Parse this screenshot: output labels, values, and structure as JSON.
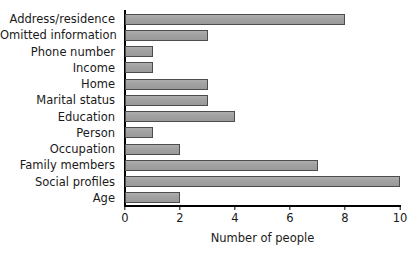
{
  "chart_data": {
    "type": "bar",
    "orientation": "horizontal",
    "title": "",
    "subtitle": "",
    "xlabel": "Number of people",
    "ylabel": "",
    "xlim": [
      0,
      10
    ],
    "xticks": [
      0,
      2,
      4,
      6,
      8,
      10
    ],
    "xtick_labels": [
      "0",
      "2",
      "4",
      "6",
      "8",
      "10"
    ],
    "grid": false,
    "legend": null,
    "categories": [
      "Address/residence",
      "Omitted information",
      "Phone number",
      "Income",
      "Home",
      "Marital status",
      "Education",
      "Person",
      "Occupation",
      "Family members",
      "Social profiles",
      "Age"
    ],
    "values": [
      8,
      3,
      1,
      1,
      3,
      3,
      4,
      1,
      2,
      7,
      10,
      2
    ],
    "bars": [
      {
        "category": "Address/residence",
        "value": 8
      },
      {
        "category": "Omitted information",
        "value": 3
      },
      {
        "category": "Phone number",
        "value": 1
      },
      {
        "category": "Income",
        "value": 1
      },
      {
        "category": "Home",
        "value": 3
      },
      {
        "category": "Marital status",
        "value": 3
      },
      {
        "category": "Education",
        "value": 4
      },
      {
        "category": "Person",
        "value": 1
      },
      {
        "category": "Occupation",
        "value": 2
      },
      {
        "category": "Family members",
        "value": 7
      },
      {
        "category": "Social profiles",
        "value": 10
      },
      {
        "category": "Age",
        "value": 2
      }
    ],
    "colors": {
      "bar_fill": "#a3a3a3",
      "bar_border": "#4c4c4c",
      "axis": "#000000",
      "text": "#1a1a1a",
      "background": "#ffffff"
    }
  }
}
